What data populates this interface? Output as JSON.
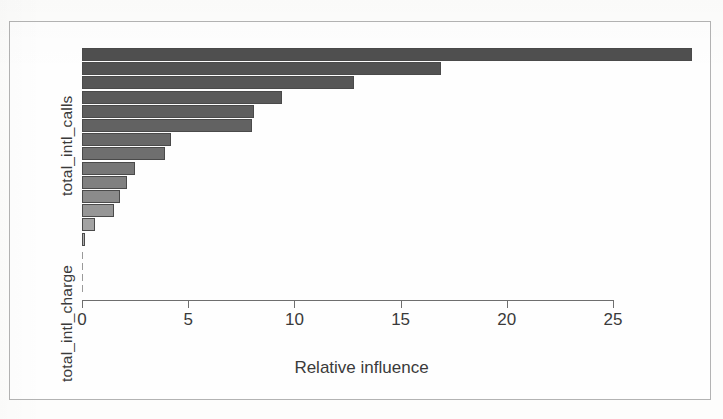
{
  "figure": {
    "background_color": "#fdfdfc",
    "frame_color": "#b9b9b9",
    "axis_color": "#6e6e6e",
    "text_color": "#3a3a3a"
  },
  "axis": {
    "y_label_top": "total_intl_calls",
    "y_label_bottom": "total_intl_charge",
    "x_label": "Relative influence",
    "x_ticks": [
      "0",
      "5",
      "10",
      "15",
      "20",
      "25"
    ]
  },
  "chart_data": {
    "type": "bar",
    "orientation": "horizontal",
    "title": "",
    "xlabel": "Relative influence",
    "ylabel": "",
    "xlim": [
      0,
      29
    ],
    "ylim": [
      0,
      14
    ],
    "grid": false,
    "legend": false,
    "axis_tick_values": [
      0,
      5,
      10,
      15,
      20,
      25
    ],
    "categories": [
      "total_intl_calls",
      "bar_2",
      "bar_3",
      "bar_4",
      "bar_5",
      "bar_6",
      "bar_7",
      "bar_8",
      "bar_9",
      "bar_10",
      "bar_11",
      "bar_12",
      "bar_13",
      "total_intl_charge"
    ],
    "values": [
      28.7,
      16.9,
      12.8,
      9.4,
      8.1,
      8.0,
      4.2,
      3.9,
      2.5,
      2.1,
      1.8,
      1.5,
      0.6,
      0.15
    ],
    "bar_colors": [
      "#4f4f4f",
      "#525252",
      "#565656",
      "#5a5a5a",
      "#5e5e5e",
      "#626262",
      "#686868",
      "#6f6f6f",
      "#777777",
      "#808080",
      "#8b8b8b",
      "#969696",
      "#a3a3a3",
      "#b0b0b0"
    ],
    "bar_edge_color": "#4a4a4a"
  }
}
